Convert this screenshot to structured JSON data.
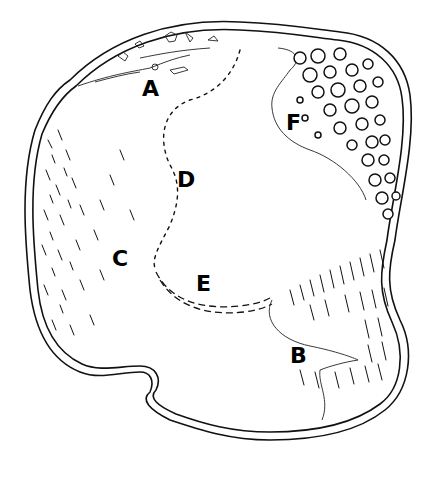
{
  "figure": {
    "labels": [
      {
        "id": "A",
        "text": "A",
        "x": 142,
        "y": 96
      },
      {
        "id": "B",
        "text": "B",
        "x": 290,
        "y": 363
      },
      {
        "id": "C",
        "text": "C",
        "x": 112,
        "y": 266
      },
      {
        "id": "D",
        "text": "D",
        "x": 177,
        "y": 187
      },
      {
        "id": "E",
        "text": "E",
        "x": 196,
        "y": 291
      },
      {
        "id": "F",
        "text": "F",
        "x": 286,
        "y": 130
      }
    ],
    "colors": {
      "ink": "#111111",
      "paper": "#ffffff"
    }
  }
}
